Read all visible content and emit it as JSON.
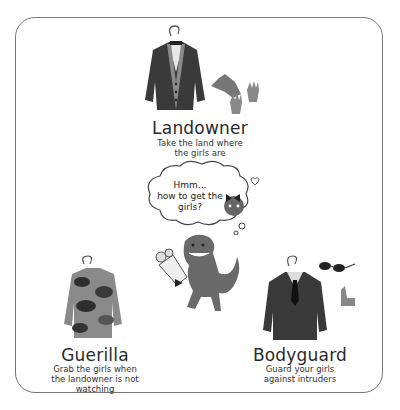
{
  "roles": [
    {
      "id": "landowner",
      "title": "Landowner",
      "description_lines": [
        "Take the land where",
        "the girls are"
      ]
    },
    {
      "id": "guerilla",
      "title": "Guerilla",
      "description_lines": [
        "Grab the girls when",
        "the landowner is not",
        "watching"
      ]
    },
    {
      "id": "bodyguard",
      "title": "Bodyguard",
      "description_lines": [
        "Guard your girls",
        "against intruders"
      ]
    }
  ],
  "thought_bubble": {
    "lines": [
      "Hmm...",
      "how to get the",
      "girls?"
    ]
  },
  "illustrations": {
    "landowner": [
      "suit-jacket-on-hanger",
      "top-hat",
      "gloves"
    ],
    "guerilla": [
      "camouflage-sweater-on-hanger"
    ],
    "bodyguard": [
      "suit-with-tie-on-hanger",
      "sunglasses",
      "earpiece"
    ],
    "center": [
      "dinosaur-with-bouquet",
      "girl-character-in-thought"
    ]
  },
  "colors": {
    "frame": "#777777",
    "cloth_dark": "#3a3a3a",
    "cloth_mid": "#6e6e6e",
    "cloth_light": "#9a9a9a",
    "dino": "#6a6a6a"
  }
}
